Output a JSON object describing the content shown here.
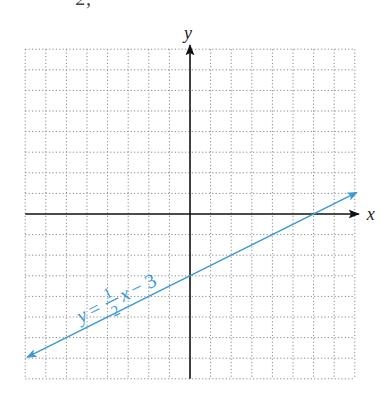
{
  "header_fragment": "2,",
  "chart_data": {
    "type": "line",
    "title": "",
    "xlabel": "x",
    "ylabel": "y",
    "xlim": [
      -8,
      8
    ],
    "ylim": [
      -8,
      8
    ],
    "grid": true,
    "grid_style": "dotted",
    "grid_step": 1,
    "tick_labels": false,
    "axes_arrows": true,
    "series": [
      {
        "name": "y = 1/2 x − 3",
        "equation": "y = (1/2)x - 3",
        "slope": 0.5,
        "intercept": -3,
        "color": "#3d9ad1",
        "arrows_both_ends": true,
        "x": [
          -8,
          -6,
          -4,
          -2,
          0,
          2,
          4,
          6,
          8
        ],
        "y": [
          -7,
          -6,
          -5,
          -4,
          -3,
          -2,
          -1,
          0,
          1
        ]
      }
    ],
    "annotations": [
      {
        "text": "y = 1/2 x − 3",
        "parts": {
          "lhs": "y",
          "eq": "=",
          "num": "1",
          "den": "2",
          "var": "x",
          "rest": "− 3"
        },
        "position": "along line, lower-left quadrant",
        "color": "#3d9ad1"
      }
    ]
  },
  "colors": {
    "axis": "#111111",
    "grid": "#8a8a8a",
    "line": "#3d9ad1",
    "background": "#ffffff"
  }
}
